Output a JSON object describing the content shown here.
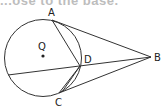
{
  "header": {
    "cut_text": "...ose to the base."
  },
  "diagram": {
    "labels": {
      "A": "A",
      "B": "B",
      "C": "C",
      "D": "D",
      "Q": "Q"
    },
    "segments": [
      "AB",
      "CB",
      "AD",
      "CD",
      "chord-through-D to B"
    ],
    "colors": {
      "stroke": "#333333",
      "text": "#222222"
    }
  }
}
